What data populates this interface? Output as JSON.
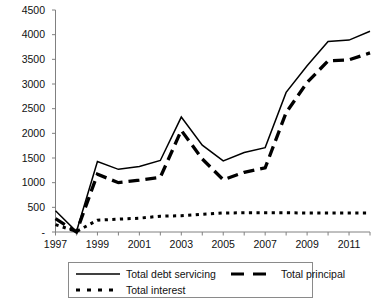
{
  "chart_data": {
    "type": "line",
    "title": "",
    "subtitle": "",
    "xlabel": "",
    "ylabel": "",
    "xlim": [
      1997,
      2012
    ],
    "ylim": [
      0,
      4500
    ],
    "ytick_values": [
      0,
      500,
      1000,
      1500,
      2000,
      2500,
      3000,
      3500,
      4000,
      4500
    ],
    "ytick_labels": [
      "-",
      "500",
      "1000",
      "1500",
      "2000",
      "2500",
      "3000",
      "3500",
      "4000",
      "4500"
    ],
    "x": [
      1997,
      1998,
      1999,
      2000,
      2001,
      2002,
      2003,
      2004,
      2005,
      2006,
      2007,
      2008,
      2009,
      2010,
      2011,
      2012
    ],
    "xtick_values": [
      1997,
      1998,
      1999,
      2000,
      2001,
      2002,
      2003,
      2004,
      2005,
      2006,
      2007,
      2008,
      2009,
      2010,
      2011,
      2012
    ],
    "xtick_labels": [
      "1997",
      "",
      "1999",
      "",
      "2001",
      "",
      "2003",
      "",
      "2005",
      "",
      "2007",
      "",
      "2009",
      "",
      "2011",
      ""
    ],
    "grid": false,
    "legend_position": "below",
    "series": [
      {
        "name": "Total debt servicing",
        "style": "solid",
        "color": "#000000",
        "values": [
          430,
          10,
          1430,
          1270,
          1330,
          1450,
          2330,
          1760,
          1440,
          1610,
          1710,
          2830,
          3370,
          3860,
          3890,
          4070
        ]
      },
      {
        "name": "Total principal",
        "style": "dashed",
        "color": "#000000",
        "values": [
          270,
          0,
          1170,
          1000,
          1050,
          1110,
          2060,
          1480,
          1060,
          1210,
          1300,
          2420,
          3030,
          3470,
          3490,
          3630
        ]
      },
      {
        "name": "Total interest",
        "style": "dotted",
        "color": "#000000",
        "values": [
          150,
          10,
          240,
          260,
          280,
          320,
          330,
          360,
          385,
          390,
          390,
          390,
          385,
          385,
          385,
          385
        ]
      }
    ]
  },
  "legend": {
    "items": [
      {
        "label": "Total debt servicing",
        "style": "solid"
      },
      {
        "label": "Total principal",
        "style": "dashed"
      },
      {
        "label": "Total interest",
        "style": "dotted"
      }
    ]
  },
  "axis": {
    "y_labels": [
      "4500",
      "4000",
      "3500",
      "3000",
      "2500",
      "2000",
      "1500",
      "1000",
      "500",
      "-"
    ],
    "x_labels": [
      "1997",
      "1999",
      "2001",
      "2003",
      "2005",
      "2007",
      "2009",
      "2011"
    ]
  },
  "colors": {
    "line": "#000000",
    "axis": "#808080",
    "legend_border": "#8a8a8a",
    "background": "#ffffff"
  }
}
